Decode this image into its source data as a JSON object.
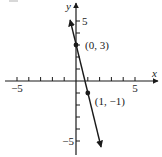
{
  "chart_data": {
    "type": "line",
    "title": "",
    "xlabel": "x",
    "ylabel": "y",
    "xlim": [
      -5.5,
      6.5
    ],
    "ylim": [
      -6,
      6
    ],
    "grid": false,
    "x_ticks": [
      -5,
      -4,
      -3,
      -2,
      -1,
      1,
      2,
      3,
      4,
      5
    ],
    "y_ticks": [
      -5,
      -4,
      -3,
      -2,
      -1,
      1,
      2,
      3,
      4,
      5
    ],
    "x_tick_labels": [
      {
        "value": -5,
        "label": "−5"
      },
      {
        "value": 5,
        "label": "5"
      }
    ],
    "y_tick_labels": [
      {
        "value": 5,
        "label": "5"
      },
      {
        "value": -5,
        "label": "−5"
      }
    ],
    "series": [
      {
        "name": "line",
        "equation": "y = -4x + 3",
        "x": [
          -0.5,
          2.125
        ],
        "y": [
          5,
          -5.5
        ],
        "arrows": "both"
      }
    ],
    "points": [
      {
        "x": 0,
        "y": 3,
        "label": "(0, 3)"
      },
      {
        "x": 1,
        "y": -1,
        "label": "(1, −1)"
      }
    ]
  }
}
